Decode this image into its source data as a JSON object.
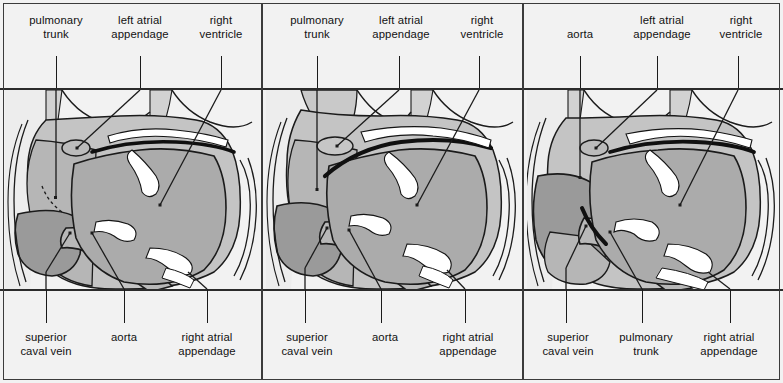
{
  "figure": {
    "panel_count": 3,
    "colors": {
      "background": "#f2f2f2",
      "frame": "#3b3b3b",
      "rule": "#2b2b2b",
      "ink": "#111111",
      "light_gray": "#d6d6d6",
      "mid_gray": "#bdbdbd",
      "dark_gray": "#9b9b9b",
      "darker_gray": "#8a8a8a",
      "highlight": "#ffffff"
    }
  },
  "panels": [
    {
      "id": "panel-1",
      "top_labels": [
        {
          "text": "pulmonary\ntrunk",
          "x": 56,
          "leader_x": 56,
          "leader_y1": 56,
          "leader_y2": 198,
          "two_line": true
        },
        {
          "text": "left atrial\nappendage",
          "x": 140,
          "leader_x": 140,
          "leader_y1": 56,
          "leader_y2": 92,
          "two_line": true
        },
        {
          "text": "right\nventricle",
          "x": 221,
          "leader_x": 221,
          "leader_y1": 56,
          "leader_y2": 92,
          "two_line": true
        }
      ],
      "bottom_labels": [
        {
          "text": "superior\ncaval vein",
          "x": 46,
          "leader_x": 46,
          "leader_y1": 289,
          "leader_y2": 323,
          "two_line": true
        },
        {
          "text": "aorta",
          "x": 124,
          "leader_x": 124,
          "leader_y1": 289,
          "leader_y2": 323,
          "two_line": false
        },
        {
          "text": "right atrial\nappendage",
          "x": 207,
          "leader_x": 207,
          "leader_y1": 289,
          "leader_y2": 323,
          "two_line": true
        }
      ]
    },
    {
      "id": "panel-2",
      "top_labels": [
        {
          "text": "pulmonary\ntrunk",
          "x": 56,
          "leader_x": 56,
          "leader_y1": 56,
          "leader_y2": 198,
          "two_line": true
        },
        {
          "text": "left atrial\nappendage",
          "x": 140,
          "leader_x": 138,
          "leader_y1": 56,
          "leader_y2": 92,
          "two_line": true
        },
        {
          "text": "right\nventricle",
          "x": 221,
          "leader_x": 218,
          "leader_y1": 56,
          "leader_y2": 92,
          "two_line": true
        }
      ],
      "bottom_labels": [
        {
          "text": "superior\ncaval vein",
          "x": 46,
          "leader_x": 44,
          "leader_y1": 289,
          "leader_y2": 323,
          "two_line": true
        },
        {
          "text": "aorta",
          "x": 124,
          "leader_x": 120,
          "leader_y1": 289,
          "leader_y2": 323,
          "two_line": false
        },
        {
          "text": "right atrial\nappendage",
          "x": 207,
          "leader_x": 204,
          "leader_y1": 289,
          "leader_y2": 323,
          "two_line": true
        }
      ]
    },
    {
      "id": "panel-3",
      "top_labels": [
        {
          "text": "aorta",
          "x": 58,
          "leader_x": 58,
          "leader_y1": 56,
          "leader_y2": 198,
          "two_line": false
        },
        {
          "text": "left atrial\nappendage",
          "x": 140,
          "leader_x": 135,
          "leader_y1": 56,
          "leader_y2": 92,
          "two_line": true
        },
        {
          "text": "right\nventricle",
          "x": 219,
          "leader_x": 216,
          "leader_y1": 56,
          "leader_y2": 92,
          "two_line": true
        }
      ],
      "bottom_labels": [
        {
          "text": "superior\ncaval vein",
          "x": 46,
          "leader_x": 44,
          "leader_y1": 289,
          "leader_y2": 323,
          "two_line": true
        },
        {
          "text": "pulmonary\ntrunk",
          "x": 124,
          "leader_x": 120,
          "leader_y1": 289,
          "leader_y2": 323,
          "two_line": true
        },
        {
          "text": "right atrial\nappendage",
          "x": 207,
          "leader_x": 208,
          "leader_y1": 289,
          "leader_y2": 323,
          "two_line": true
        }
      ]
    }
  ]
}
